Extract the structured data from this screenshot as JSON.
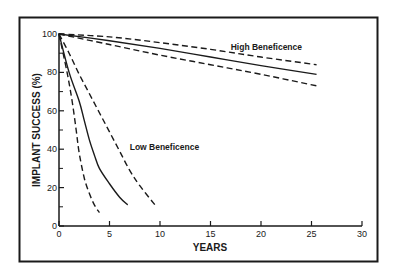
{
  "chart_data": {
    "type": "line",
    "title": "",
    "xlabel": "YEARS",
    "ylabel": "IMPLANT SUCCESS (%)",
    "xlim": [
      0,
      30
    ],
    "ylim": [
      0,
      100
    ],
    "x_ticks": [
      0,
      5,
      10,
      15,
      20,
      25,
      30
    ],
    "y_ticks": [
      0,
      20,
      40,
      60,
      80,
      100
    ],
    "y_minor_ticks": [
      10,
      30,
      50,
      70,
      90
    ],
    "grid": false,
    "legend": null,
    "annotations": [
      {
        "text": "High Beneficence",
        "x": 17,
        "y": 93
      },
      {
        "text": "Low Beneficence",
        "x": 7,
        "y": 41
      }
    ],
    "series": [
      {
        "name": "High Beneficence (upper bound)",
        "style": "dashed",
        "x": [
          0,
          5,
          10,
          15,
          20,
          25.5
        ],
        "y": [
          100,
          98.5,
          95.5,
          92,
          88,
          84
        ]
      },
      {
        "name": "High Beneficence (mean)",
        "style": "solid",
        "x": [
          0,
          5,
          10,
          15,
          20,
          25.5
        ],
        "y": [
          100,
          96.5,
          92.5,
          88,
          83.5,
          79
        ]
      },
      {
        "name": "High Beneficence (lower bound)",
        "style": "dashed",
        "x": [
          0,
          5,
          10,
          15,
          20,
          25.5
        ],
        "y": [
          100,
          94.5,
          89,
          84,
          79,
          73
        ]
      },
      {
        "name": "Low Beneficence (upper bound)",
        "style": "dashed",
        "x": [
          0,
          1,
          2,
          3,
          4,
          5,
          6,
          7,
          8,
          9.5
        ],
        "y": [
          100,
          90,
          79,
          69,
          59,
          49,
          39,
          29,
          21,
          11
        ]
      },
      {
        "name": "Low Beneficence (mean)",
        "style": "solid",
        "x": [
          0,
          1,
          2,
          2.5,
          3,
          3.5,
          4,
          5,
          6,
          6.8
        ],
        "y": [
          100,
          80,
          65,
          55,
          45,
          37,
          30,
          22,
          15,
          11
        ]
      },
      {
        "name": "Low Beneficence (lower bound)",
        "style": "dashed",
        "x": [
          0,
          0.8,
          1.3,
          1.7,
          2,
          2.5,
          3,
          3.5,
          4
        ],
        "y": [
          100,
          80,
          65,
          50,
          38,
          25,
          17,
          11,
          7
        ]
      }
    ]
  }
}
